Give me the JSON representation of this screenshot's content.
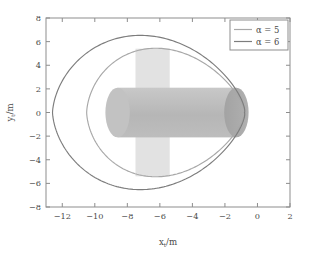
{
  "chart_data": {
    "type": "line",
    "title": "",
    "xlabel": "x_t/m",
    "ylabel": "y_t/m",
    "xlim": [
      -13,
      2
    ],
    "ylim": [
      -8,
      8
    ],
    "xticks": [
      -12,
      -10,
      -8,
      -6,
      -4,
      -2,
      0,
      2
    ],
    "yticks": [
      -8,
      -6,
      -4,
      -2,
      0,
      2,
      4,
      6,
      8
    ],
    "xticklabels": [
      "-12",
      "-10",
      "-8",
      "-6",
      "-4",
      "-2",
      "0",
      "2"
    ],
    "yticklabels": [
      "-8",
      "-6",
      "-4",
      "-2",
      "0",
      "2",
      "4",
      "6",
      "8"
    ],
    "grid": false,
    "legend_position": "upper right",
    "series": [
      {
        "name": "alpha = 5",
        "label": "α = 5",
        "color": "#a8a8a8",
        "cusp_x": -0.8,
        "left_extent": -10.5,
        "peak_y": 6.5,
        "min_y": -6.5,
        "peak_x": -4.6
      },
      {
        "name": "alpha = 6",
        "label": "α = 6",
        "color": "#7d7d7d",
        "cusp_x": -0.8,
        "left_extent": -12.6,
        "peak_y": 7.8,
        "min_y": -7.8,
        "peak_x": -5.0
      }
    ],
    "annotations": [
      {
        "name": "vertical-plate",
        "shape": "rectangle",
        "x_range": [
          -7.5,
          -5.4
        ],
        "y_range": [
          -5.4,
          5.4
        ],
        "color": "#e2e2e2"
      },
      {
        "name": "cylinder-body",
        "shape": "cylinder",
        "x_range": [
          -8.6,
          -1.3
        ],
        "y_range": [
          -2.1,
          2.1
        ],
        "color": "#bcbcbc"
      },
      {
        "name": "cylinder-end-cap",
        "shape": "ellipse",
        "center": [
          -1.3,
          0
        ],
        "radii": [
          0.75,
          2.1
        ],
        "color": "#a9a9a9"
      }
    ]
  },
  "legend": {
    "items": [
      {
        "label": "α = 5",
        "alpha_symbol": "α",
        "equals": "=",
        "value": "5",
        "color": "#a8a8a8"
      },
      {
        "label": "α = 6",
        "alpha_symbol": "α",
        "equals": "=",
        "value": "6",
        "color": "#7d7d7d"
      }
    ]
  },
  "axes": {
    "x_label_main": "x",
    "x_label_sub": "t",
    "x_label_unit": "/m",
    "y_label_main": "y",
    "y_label_sub": "t",
    "y_label_unit": "/m"
  }
}
